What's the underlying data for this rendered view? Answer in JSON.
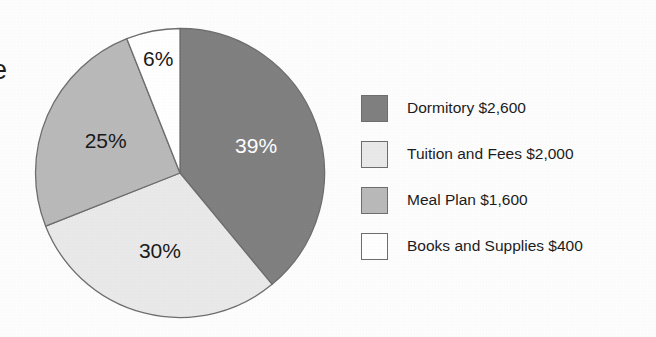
{
  "page": {
    "background_color": "#fdfdfd",
    "edge_fragment_text": "e"
  },
  "chart_data": {
    "type": "pie",
    "title": "",
    "subtitle": "",
    "xlabel": "",
    "ylabel": "",
    "grid": false,
    "legend_position": "right",
    "start_angle_deg": 0,
    "direction": "clockwise",
    "total_value": 6600,
    "currency": "$",
    "categories": [
      "Dormitory",
      "Tuition and Fees",
      "Meal Plan",
      "Books and Supplies"
    ],
    "values": [
      2600,
      2000,
      1600,
      400
    ],
    "percent_values": [
      39,
      30,
      25,
      6
    ],
    "percent_labels": [
      "39%",
      "30%",
      "25%",
      "6%"
    ],
    "value_labels": [
      "$2,600",
      "$2,000",
      "$1,600",
      "$400"
    ],
    "slice_colors": [
      "#808080",
      "#e9e9e9",
      "#b9b9b9",
      "#ffffff"
    ],
    "slice_label_colors": [
      "#ffffff",
      "#1a1a1a",
      "#1a1a1a",
      "#1a1a1a"
    ],
    "slice_outline_color": "#6e6e6e",
    "slices": [
      {
        "name": "Dormitory",
        "value": 2600,
        "value_label": "$2,600",
        "percent": 39,
        "percent_label": "39%",
        "color": "#808080",
        "label_color": "#ffffff",
        "legend_label": "Dormitory $2,600"
      },
      {
        "name": "Tuition and Fees",
        "value": 2000,
        "value_label": "$2,000",
        "percent": 30,
        "percent_label": "30%",
        "color": "#e9e9e9",
        "label_color": "#1a1a1a",
        "legend_label": "Tuition and Fees $2,000"
      },
      {
        "name": "Meal Plan",
        "value": 1600,
        "value_label": "$1,600",
        "percent": 25,
        "percent_label": "25%",
        "color": "#b9b9b9",
        "label_color": "#1a1a1a",
        "legend_label": "Meal Plan $1,600"
      },
      {
        "name": "Books and Supplies",
        "value": 400,
        "value_label": "$400",
        "percent": 6,
        "percent_label": "6%",
        "color": "#ffffff",
        "label_color": "#1a1a1a",
        "legend_label": "Books and Supplies $400"
      }
    ]
  },
  "legend": {
    "items": [
      {
        "label": "Dormitory $2,600",
        "color": "#808080"
      },
      {
        "label": "Tuition and Fees $2,000",
        "color": "#e9e9e9"
      },
      {
        "label": "Meal Plan $1,600",
        "color": "#b9b9b9"
      },
      {
        "label": "Books and Supplies $400",
        "color": "#ffffff"
      }
    ]
  }
}
